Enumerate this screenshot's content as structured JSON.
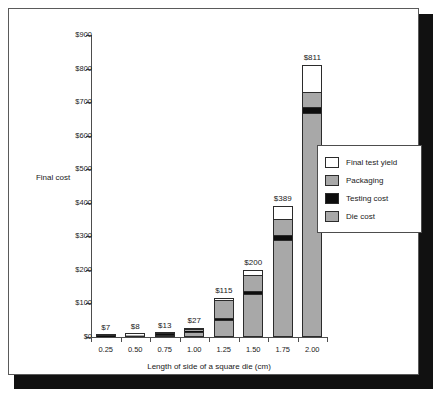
{
  "chart_data": {
    "type": "bar",
    "stacked": true,
    "title": "",
    "xlabel": "Length of side of a square die (cm)",
    "ylabel": "Final cost",
    "categories": [
      "0.25",
      "0.50",
      "0.75",
      "1.00",
      "1.25",
      "1.50",
      "1.75",
      "2.00"
    ],
    "ylim": [
      0,
      900
    ],
    "yticks": [
      0,
      100,
      200,
      300,
      400,
      500,
      600,
      700,
      800,
      900
    ],
    "ytick_labels": [
      "$0",
      "$100",
      "$200",
      "$300",
      "$400",
      "$500",
      "$600",
      "$700",
      "$800",
      "$900"
    ],
    "grid": false,
    "legend_position": "right-middle",
    "series": [
      {
        "name": "Die cost",
        "color": "#a8a8a8",
        "values": [
          1,
          3,
          7,
          16,
          50,
          128,
          290,
          668
        ]
      },
      {
        "name": "Testing cost",
        "color": "#0d0d0d",
        "values": [
          1,
          1,
          2,
          3,
          6,
          10,
          14,
          18
        ]
      },
      {
        "name": "Packaging",
        "color": "#a8a8a8",
        "values": [
          4,
          3,
          3,
          4,
          55,
          46,
          48,
          45
        ]
      },
      {
        "name": "Final test yield",
        "color": "#ffffff",
        "values": [
          1,
          1,
          1,
          4,
          4,
          16,
          37,
          80
        ]
      }
    ],
    "totals": [
      7,
      8,
      13,
      27,
      115,
      200,
      389,
      811
    ],
    "total_labels": [
      "$7",
      "$8",
      "$13",
      "$27",
      "$115",
      "$200",
      "$389",
      "$811"
    ]
  },
  "legend": {
    "items": [
      {
        "label": "Final test yield",
        "swatch": "#ffffff"
      },
      {
        "label": "Packaging",
        "swatch": "#a8a8a8"
      },
      {
        "label": "Testing cost",
        "swatch": "#0d0d0d"
      },
      {
        "label": "Die cost",
        "swatch": "#a8a8a8"
      }
    ]
  }
}
